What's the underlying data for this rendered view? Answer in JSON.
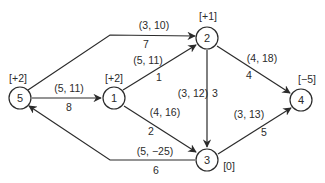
{
  "diagram": {
    "type": "network-flow",
    "nodes": [
      {
        "id": "1",
        "supply": "[+2]"
      },
      {
        "id": "2",
        "supply": "[+1]"
      },
      {
        "id": "3",
        "supply": "[0]"
      },
      {
        "id": "4",
        "supply": "[−5]"
      },
      {
        "id": "5",
        "supply": "[+2]"
      }
    ],
    "edges": [
      {
        "name": "edge-5-2",
        "from": "5",
        "to": "2",
        "params": "(3, 10)",
        "index": "7"
      },
      {
        "name": "edge-1-2",
        "from": "1",
        "to": "2",
        "params": "(5, 11)",
        "index": "1"
      },
      {
        "name": "edge-5-1",
        "from": "5",
        "to": "1",
        "params": "(5, 11)",
        "index": "8"
      },
      {
        "name": "edge-1-3",
        "from": "1",
        "to": "3",
        "params": "(4, 16)",
        "index": "2"
      },
      {
        "name": "edge-2-3",
        "from": "2",
        "to": "3",
        "params": "(3, 12)",
        "index": "3"
      },
      {
        "name": "edge-2-4",
        "from": "2",
        "to": "4",
        "params": "(4, 18)",
        "index": "4"
      },
      {
        "name": "edge-3-4",
        "from": "3",
        "to": "4",
        "params": "(3, 13)",
        "index": "5"
      },
      {
        "name": "edge-3-5",
        "from": "3",
        "to": "5",
        "params": "(5, −25)",
        "index": "6"
      }
    ],
    "colors": {
      "stroke": "#2b2b2b",
      "background": "#ffffff"
    }
  }
}
